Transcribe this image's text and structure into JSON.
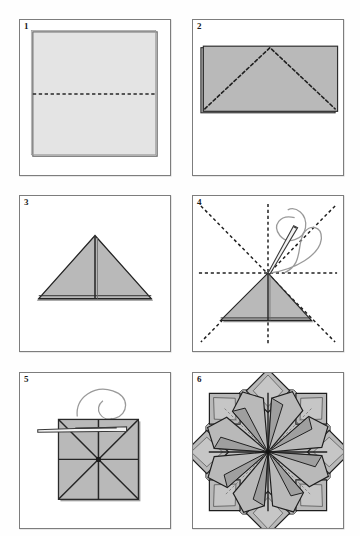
{
  "page": {
    "kind": "instruction-diagram",
    "background_color": "#fefefe",
    "width": 360,
    "height": 536,
    "cropped_header_fragment_left": "",
    "cropped_header_fragment_right": ""
  },
  "palette": {
    "panel_border": "#7d7d7d",
    "paper_light": "#e4e4e4",
    "paper_mid": "#b9b9b9",
    "paper_shade": "#a8a8a8",
    "paper_edge": "#2b2b2b",
    "fold_dash": "#1f1f1f",
    "thread": "#9a9a9a",
    "needle_fill": "#f4f4f4",
    "needle_stroke": "#3a3a3a",
    "number_color": "#1a1a1a"
  },
  "grid": {
    "columns": 2,
    "rows": 3,
    "panel_width": 150,
    "panel_height": 156
  },
  "panels": [
    {
      "number": "1",
      "name": "square-sheet-with-horizontal-crease",
      "x": 19,
      "y": 19,
      "width": 152,
      "height": 157,
      "caption": "Square sheet, valley crease across the middle",
      "shapes": {
        "sheet": {
          "fill": "paper_light",
          "inset": 12
        },
        "crease": {
          "type": "dashed-horizontal",
          "position": "center"
        }
      }
    },
    {
      "number": "2",
      "name": "folded-rectangle-with-diagonal-creases",
      "x": 192,
      "y": 19,
      "width": 152,
      "height": 157,
      "caption": "Folded in half to a rectangle; dashed diagonals mark the next folds",
      "shapes": {
        "sheet": {
          "fill": "paper_mid"
        },
        "creases": {
          "type": "dashed-triangle",
          "apex": "top-center"
        },
        "layer_edge": "left"
      }
    },
    {
      "number": "3",
      "name": "waterbomb-base-triangle",
      "x": 19,
      "y": 195,
      "width": 152,
      "height": 157,
      "caption": "Corners folded in to form a triangle (waterbomb base)",
      "shapes": {
        "triangle": {
          "fill": "paper_mid",
          "apex": "top-center"
        },
        "center_seam": {
          "type": "vertical-line"
        }
      }
    },
    {
      "number": "4",
      "name": "triangle-on-creased-square-with-needle",
      "x": 192,
      "y": 195,
      "width": 152,
      "height": 157,
      "caption": "Triangle positioned on the creased square; needle and thread enter at the centre",
      "shapes": {
        "crease_grid": {
          "type": "dashed-star",
          "lines": [
            "horizontal",
            "vertical",
            "diagonal-1",
            "diagonal-2"
          ]
        },
        "triangle": {
          "fill": "paper_mid",
          "apex": "center"
        },
        "needle": {
          "angle": "up-right"
        },
        "thread": {
          "type": "looping-curve"
        }
      }
    },
    {
      "number": "5",
      "name": "flattened-square-module-being-threaded",
      "x": 19,
      "y": 372,
      "width": 152,
      "height": 157,
      "caption": "Modules stacked square and threaded together through the centre",
      "shapes": {
        "square": {
          "fill": "paper_mid"
        },
        "creases": {
          "type": "x-and-plus"
        },
        "needle": {
          "angle": "horizontal"
        },
        "thread": {
          "type": "looping-curve"
        }
      }
    },
    {
      "number": "6",
      "name": "finished-eight-point-star-rosette",
      "x": 192,
      "y": 372,
      "width": 152,
      "height": 157,
      "caption": "Finished eight-pointed star rosette, points fanned out",
      "shapes": {
        "rosette": {
          "points": 8,
          "fill": "paper_mid",
          "rotation_offset_deg": 22
        }
      }
    }
  ]
}
